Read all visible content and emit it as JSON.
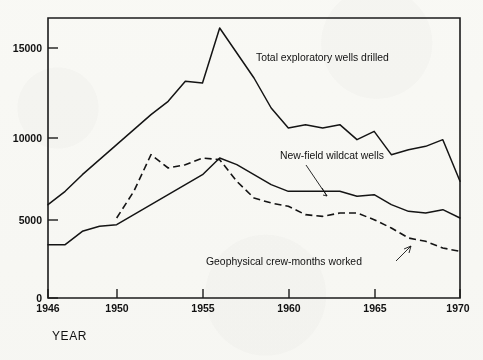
{
  "figure": {
    "background_color": "#fbfbf9",
    "ink_color": "#141414",
    "xaxis_title": "YEAR"
  },
  "axis": {
    "y_ticklabels": [
      "0",
      "5000",
      "10000",
      "15000"
    ],
    "y_tickvalues": [
      0,
      5000,
      10000,
      15000
    ],
    "x_ticklabels": [
      "1946",
      "1950",
      "1955",
      "1960",
      "1965",
      "1970"
    ],
    "x_tickvalues": [
      1946,
      1950,
      1955,
      1960,
      1965,
      1970
    ]
  },
  "labels": {
    "total": "Total exploratory wells drilled",
    "wildcat": "New-field wildcat wells",
    "geophysical": "Geophysical crew-months worked"
  },
  "chart_data": {
    "type": "line",
    "title": "",
    "xlabel": "YEAR",
    "ylabel": "",
    "xlim": [
      1946,
      1970
    ],
    "ylim": [
      0,
      16800
    ],
    "grid": false,
    "legend_position": "inline-annotations",
    "x": [
      1946,
      1947,
      1948,
      1949,
      1950,
      1951,
      1952,
      1953,
      1954,
      1955,
      1956,
      1957,
      1958,
      1959,
      1960,
      1961,
      1962,
      1963,
      1964,
      1965,
      1966,
      1967,
      1968,
      1969,
      1970
    ],
    "series": [
      {
        "name": "Total exploratory wells drilled",
        "style": "solid",
        "color": "#141414",
        "values": [
          5600,
          6400,
          7400,
          8300,
          9200,
          10100,
          11000,
          11800,
          13000,
          12900,
          16200,
          14700,
          13200,
          11400,
          10200,
          10400,
          10200,
          10400,
          9500,
          10000,
          8600,
          8900,
          9100,
          9500,
          7000
        ]
      },
      {
        "name": "New-field wildcat wells",
        "style": "solid",
        "color": "#141414",
        "values": [
          3200,
          3200,
          4000,
          4300,
          4400,
          5000,
          5600,
          6200,
          6800,
          7400,
          8400,
          8000,
          7400,
          6800,
          6400,
          6400,
          6400,
          6400,
          6100,
          6200,
          5600,
          5200,
          5100,
          5300,
          4800
        ]
      },
      {
        "name": "Geophysical crew-months worked",
        "style": "dashed",
        "color": "#141414",
        "values": [
          null,
          null,
          null,
          null,
          4800,
          6400,
          8600,
          7800,
          8000,
          8400,
          8300,
          7000,
          6000,
          5700,
          5500,
          5000,
          4900,
          5100,
          5100,
          4700,
          4200,
          3600,
          3400,
          3000,
          2800
        ]
      }
    ]
  }
}
